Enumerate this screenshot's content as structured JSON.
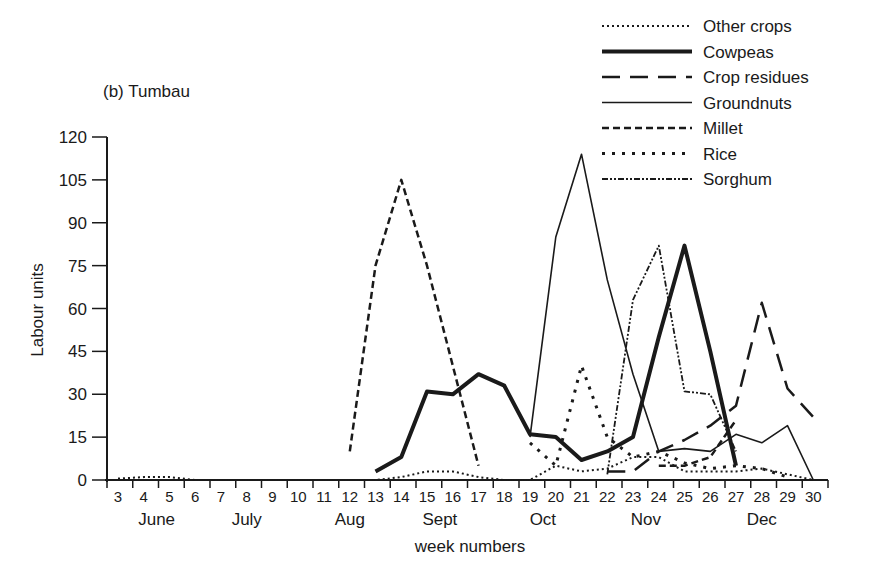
{
  "chart_data": {
    "type": "line",
    "title": "(b) Tumbau",
    "xlabel": "week numbers",
    "ylabel": "Labour units",
    "ylim": [
      0,
      120
    ],
    "yticks": [
      0,
      15,
      30,
      45,
      60,
      75,
      90,
      105,
      120
    ],
    "x": [
      3,
      4,
      5,
      6,
      7,
      8,
      9,
      10,
      11,
      12,
      13,
      14,
      15,
      16,
      17,
      18,
      19,
      20,
      21,
      22,
      23,
      24,
      25,
      26,
      27,
      28,
      29,
      30
    ],
    "months": [
      {
        "label": "June",
        "center_week": 4.5
      },
      {
        "label": "July",
        "center_week": 8
      },
      {
        "label": "Aug",
        "center_week": 12
      },
      {
        "label": "Sept",
        "center_week": 15.5
      },
      {
        "label": "Oct",
        "center_week": 19.5
      },
      {
        "label": "Nov",
        "center_week": 23.5
      },
      {
        "label": "Dec",
        "center_week": 28
      }
    ],
    "grid": false,
    "legend_position": "top-right",
    "series": [
      {
        "name": "Other crops",
        "style": "fine-dotted",
        "points": [
          [
            3,
            0.5
          ],
          [
            4,
            1
          ],
          [
            5,
            1
          ],
          [
            6,
            0
          ],
          [
            7,
            0
          ],
          [
            8,
            0
          ],
          [
            9,
            0
          ],
          [
            10,
            0
          ],
          [
            11,
            0
          ],
          [
            12,
            0
          ],
          [
            13,
            0
          ],
          [
            14,
            1
          ],
          [
            15,
            3
          ],
          [
            16,
            3
          ],
          [
            17,
            1
          ],
          [
            18,
            0
          ],
          [
            19,
            0
          ],
          [
            20,
            5
          ],
          [
            21,
            3
          ],
          [
            22,
            4
          ],
          [
            23,
            8
          ],
          [
            24,
            8
          ],
          [
            25,
            3
          ],
          [
            26,
            3
          ],
          [
            27,
            3
          ],
          [
            28,
            4
          ],
          [
            29,
            2
          ],
          [
            30,
            0
          ]
        ]
      },
      {
        "name": "Cowpeas",
        "style": "thick-solid",
        "points": [
          [
            13,
            3
          ],
          [
            14,
            8
          ],
          [
            15,
            31
          ],
          [
            16,
            30
          ],
          [
            17,
            37
          ],
          [
            18,
            33
          ],
          [
            19,
            16
          ],
          [
            20,
            15
          ],
          [
            21,
            7
          ],
          [
            22,
            10
          ],
          [
            23,
            15
          ],
          [
            24,
            50
          ],
          [
            25,
            82
          ],
          [
            26,
            45
          ],
          [
            27,
            5
          ]
        ]
      },
      {
        "name": "Crop residues",
        "style": "long-dash",
        "points": [
          [
            22,
            3
          ],
          [
            23,
            3
          ],
          [
            24,
            10
          ],
          [
            25,
            14
          ],
          [
            26,
            19
          ],
          [
            27,
            26
          ],
          [
            28,
            62
          ],
          [
            29,
            32
          ],
          [
            30,
            22
          ]
        ]
      },
      {
        "name": "Groundnuts",
        "style": "thin-solid",
        "points": [
          [
            19,
            15
          ],
          [
            20,
            85
          ],
          [
            21,
            114
          ],
          [
            22,
            70
          ],
          [
            23,
            37
          ],
          [
            24,
            10
          ],
          [
            25,
            11
          ],
          [
            26,
            10
          ],
          [
            27,
            16
          ],
          [
            28,
            13
          ],
          [
            29,
            19
          ],
          [
            30,
            0
          ]
        ]
      },
      {
        "name": "Millet",
        "style": "short-dash",
        "points": [
          [
            12,
            10
          ],
          [
            13,
            75
          ],
          [
            14,
            105
          ],
          [
            15,
            75
          ],
          [
            16,
            40
          ],
          [
            17,
            5
          ],
          [
            null,
            null
          ],
          [
            24,
            5
          ],
          [
            25,
            5
          ],
          [
            26,
            8
          ],
          [
            27,
            21
          ]
        ]
      },
      {
        "name": "Rice",
        "style": "spaced-dots",
        "points": [
          [
            19,
            13
          ],
          [
            20,
            5
          ],
          [
            21,
            40
          ],
          [
            22,
            15
          ],
          [
            23,
            8
          ],
          [
            24,
            10
          ],
          [
            25,
            6
          ],
          [
            26,
            4
          ],
          [
            27,
            5
          ],
          [
            28,
            4
          ],
          [
            29,
            1
          ]
        ]
      },
      {
        "name": "Sorghum",
        "style": "dash-dot-dot",
        "points": [
          [
            22,
            2
          ],
          [
            23,
            63
          ],
          [
            24,
            82
          ],
          [
            25,
            31
          ],
          [
            26,
            30
          ],
          [
            27,
            10
          ]
        ]
      }
    ]
  }
}
